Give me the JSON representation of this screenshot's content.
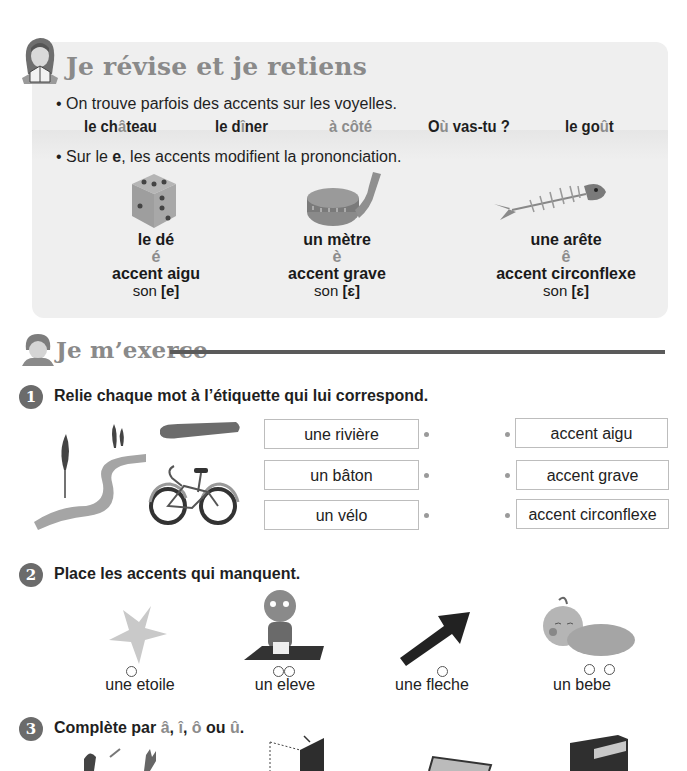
{
  "review": {
    "title": "Je révise et je retiens",
    "bullet1": "• On trouve parfois des accents sur les voyelles.",
    "examples": [
      "le château",
      "le dîner",
      "à côté",
      "Où vas-tu ?",
      "le goût"
    ],
    "bullet2_prefix": "• Sur le ",
    "bullet2_letter": "e",
    "bullet2_suffix": ", les accents modifient la prononciation.",
    "cards": [
      {
        "image": "dice-image",
        "word": "le dé",
        "letter": "é",
        "name": "accent aigu",
        "sound_prefix": "son ",
        "sound": "[e]"
      },
      {
        "image": "tape-measure-image",
        "word": "un mètre",
        "letter": "è",
        "name": "accent grave",
        "sound_prefix": "son ",
        "sound": "[ɛ]"
      },
      {
        "image": "fish-bone-image",
        "word": "une arête",
        "letter": "ê",
        "name": "accent circonflexe",
        "sound_prefix": "son ",
        "sound": "[ɛ]"
      }
    ]
  },
  "exercise_section": {
    "title": "Je m’exerce"
  },
  "exercise1": {
    "number": "1",
    "instruction": "Relie chaque mot à l’étiquette qui lui correspond.",
    "words": [
      "une rivière",
      "un bâton",
      "un vélo"
    ],
    "labels": [
      "accent aigu",
      "accent grave",
      "accent circonflexe"
    ]
  },
  "exercise2": {
    "number": "2",
    "instruction": "Place les accents qui manquent.",
    "items": [
      {
        "image": "star-image",
        "word": "une etoile",
        "blanks": 1
      },
      {
        "image": "student-reading-image",
        "word": "un eleve",
        "blanks": 2
      },
      {
        "image": "arrow-image",
        "word": "une fleche",
        "blanks": 1
      },
      {
        "image": "baby-image",
        "word": "un bebe",
        "blanks": 2
      }
    ]
  },
  "exercise3": {
    "number": "3",
    "instruction_prefix": "Complète par ",
    "options": [
      "â",
      "î",
      "ô",
      "û"
    ],
    "sep": ", ",
    "or": " ou ",
    "end": "."
  }
}
